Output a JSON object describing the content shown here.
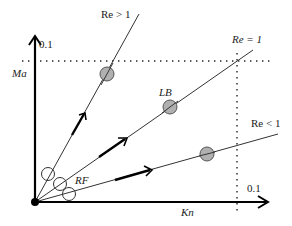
{
  "diagram": {
    "axes": {
      "x_label": "Kn",
      "y_label": "Ma",
      "x_tick": "0.1",
      "y_tick": "0.1"
    },
    "lines": [
      {
        "label": "Re > 1",
        "marker": ""
      },
      {
        "label": "Re = 1",
        "marker": "LB"
      },
      {
        "label": "Re < 1",
        "marker": ""
      }
    ],
    "region_label": "RF",
    "colors": {
      "axis": "#000000",
      "line": "#333333",
      "marker_fill": "#b0b0b0",
      "marker_stroke": "#555555"
    }
  }
}
